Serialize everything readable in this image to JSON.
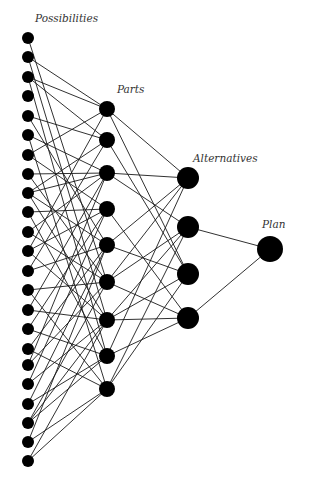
{
  "diagram": {
    "type": "layered-network",
    "colors": {
      "node": "#000000",
      "edge": "#1a1a1a",
      "label": "#333333",
      "background": "#ffffff"
    },
    "layers": [
      {
        "id": "possibilities",
        "label": "Possibilities",
        "label_pos": [
          35,
          22
        ],
        "label_size": 10.5,
        "x": 28,
        "radius": 6,
        "nodes_y": [
          38,
          57,
          77,
          96,
          116,
          135,
          155,
          174,
          193,
          212,
          232,
          251,
          271,
          290,
          310,
          329,
          349,
          365,
          384,
          404,
          423,
          442,
          461
        ]
      },
      {
        "id": "parts",
        "label": "Parts",
        "label_pos": [
          117,
          93
        ],
        "label_size": 10.5,
        "x": 107,
        "radius": 8,
        "nodes_y": [
          109,
          140,
          173,
          209,
          245,
          282,
          320,
          356,
          389
        ]
      },
      {
        "id": "alternatives",
        "label": "Alternatives",
        "label_pos": [
          193,
          162
        ],
        "label_size": 10.5,
        "x": 188,
        "radius": 11,
        "nodes_y": [
          178,
          227,
          274,
          318
        ]
      },
      {
        "id": "plan",
        "label": "Plan",
        "label_pos": [
          262,
          228
        ],
        "label_size": 10.5,
        "x": 270,
        "radius": 13,
        "nodes_y": [
          249
        ]
      }
    ],
    "edges_possibilities_to_parts": [
      [
        0,
        5
      ],
      [
        1,
        0
      ],
      [
        1,
        6
      ],
      [
        2,
        0
      ],
      [
        2,
        1
      ],
      [
        2,
        7
      ],
      [
        4,
        1
      ],
      [
        4,
        4
      ],
      [
        5,
        2
      ],
      [
        5,
        8
      ],
      [
        6,
        0
      ],
      [
        6,
        3
      ],
      [
        7,
        2
      ],
      [
        7,
        5
      ],
      [
        8,
        1
      ],
      [
        8,
        2
      ],
      [
        8,
        4
      ],
      [
        8,
        6
      ],
      [
        9,
        3
      ],
      [
        9,
        7
      ],
      [
        10,
        2
      ],
      [
        10,
        5
      ],
      [
        11,
        0
      ],
      [
        11,
        3
      ],
      [
        11,
        6
      ],
      [
        12,
        1
      ],
      [
        12,
        4
      ],
      [
        13,
        5
      ],
      [
        13,
        8
      ],
      [
        14,
        2
      ],
      [
        14,
        6
      ],
      [
        15,
        3
      ],
      [
        15,
        7
      ],
      [
        16,
        4
      ],
      [
        16,
        8
      ],
      [
        17,
        5
      ],
      [
        17,
        2
      ],
      [
        18,
        6
      ],
      [
        18,
        3
      ],
      [
        19,
        7
      ],
      [
        19,
        4
      ],
      [
        20,
        5
      ],
      [
        20,
        6
      ],
      [
        20,
        7
      ],
      [
        21,
        8
      ],
      [
        21,
        4
      ],
      [
        22,
        6
      ],
      [
        22,
        8
      ]
    ],
    "edges_parts_to_alternatives": [
      [
        0,
        0
      ],
      [
        0,
        2
      ],
      [
        1,
        2
      ],
      [
        2,
        0
      ],
      [
        2,
        1
      ],
      [
        3,
        3
      ],
      [
        4,
        0
      ],
      [
        4,
        2
      ],
      [
        5,
        0
      ],
      [
        5,
        1
      ],
      [
        5,
        3
      ],
      [
        6,
        1
      ],
      [
        6,
        2
      ],
      [
        6,
        3
      ],
      [
        7,
        0
      ],
      [
        7,
        3
      ],
      [
        8,
        1
      ],
      [
        8,
        2
      ]
    ],
    "edges_alternatives_to_plan": [
      [
        1,
        0
      ],
      [
        3,
        0
      ]
    ]
  }
}
